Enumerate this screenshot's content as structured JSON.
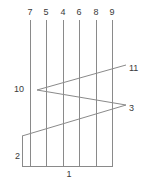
{
  "figure": {
    "width": 155,
    "height": 184,
    "background_color": "#ffffff",
    "line_color": "#8a8a8a",
    "label_color": "#3a3a3a",
    "label_font_size_px": 9
  },
  "labels": {
    "top": [
      {
        "text": "7",
        "x": 30,
        "y": 8
      },
      {
        "text": "5",
        "x": 46,
        "y": 8
      },
      {
        "text": "4",
        "x": 63,
        "y": 8
      },
      {
        "text": "6",
        "x": 79,
        "y": 8
      },
      {
        "text": "8",
        "x": 96,
        "y": 8
      },
      {
        "text": "9",
        "x": 112,
        "y": 8
      }
    ],
    "left": [
      {
        "text": "10",
        "x": 24,
        "y": 89
      },
      {
        "text": "2",
        "x": 20,
        "y": 156
      }
    ],
    "right": [
      {
        "text": "11",
        "x": 129,
        "y": 68
      },
      {
        "text": "3",
        "x": 129,
        "y": 108
      }
    ],
    "bottom": [
      {
        "text": "1",
        "x": 69,
        "y": 170
      }
    ]
  },
  "geometry": {
    "vertical_lines": [
      {
        "name": "strand-7",
        "x": 30,
        "y1": 20,
        "y2": 166
      },
      {
        "name": "strand-5",
        "x": 46,
        "y1": 20,
        "y2": 166
      },
      {
        "name": "strand-4",
        "x": 63,
        "y1": 20,
        "y2": 166
      },
      {
        "name": "strand-6",
        "x": 79,
        "y1": 20,
        "y2": 166
      },
      {
        "name": "strand-8",
        "x": 96,
        "y1": 20,
        "y2": 166
      },
      {
        "name": "strand-9",
        "x": 112,
        "y1": 20,
        "y2": 166
      }
    ],
    "left_stub": {
      "name": "left-edge",
      "x": 22,
      "y1": 136,
      "y2": 166
    },
    "bottom_line": {
      "name": "baseline",
      "x1": 22,
      "x2": 113,
      "y": 166
    },
    "diagonals": [
      {
        "name": "line-10-to-11",
        "x1": 37,
        "y1": 90,
        "x2": 126,
        "y2": 65
      },
      {
        "name": "line-10-to-3",
        "x1": 37,
        "y1": 90,
        "x2": 126,
        "y2": 105
      },
      {
        "name": "line-2-to-3",
        "x1": 22,
        "y1": 136,
        "x2": 126,
        "y2": 105
      }
    ],
    "vertex_points": [
      {
        "name": "vertex-10",
        "x": 37,
        "y": 90
      },
      {
        "name": "vertex-2",
        "x": 22,
        "y": 136
      },
      {
        "name": "crossing",
        "x": 112,
        "y": 108
      }
    ]
  }
}
